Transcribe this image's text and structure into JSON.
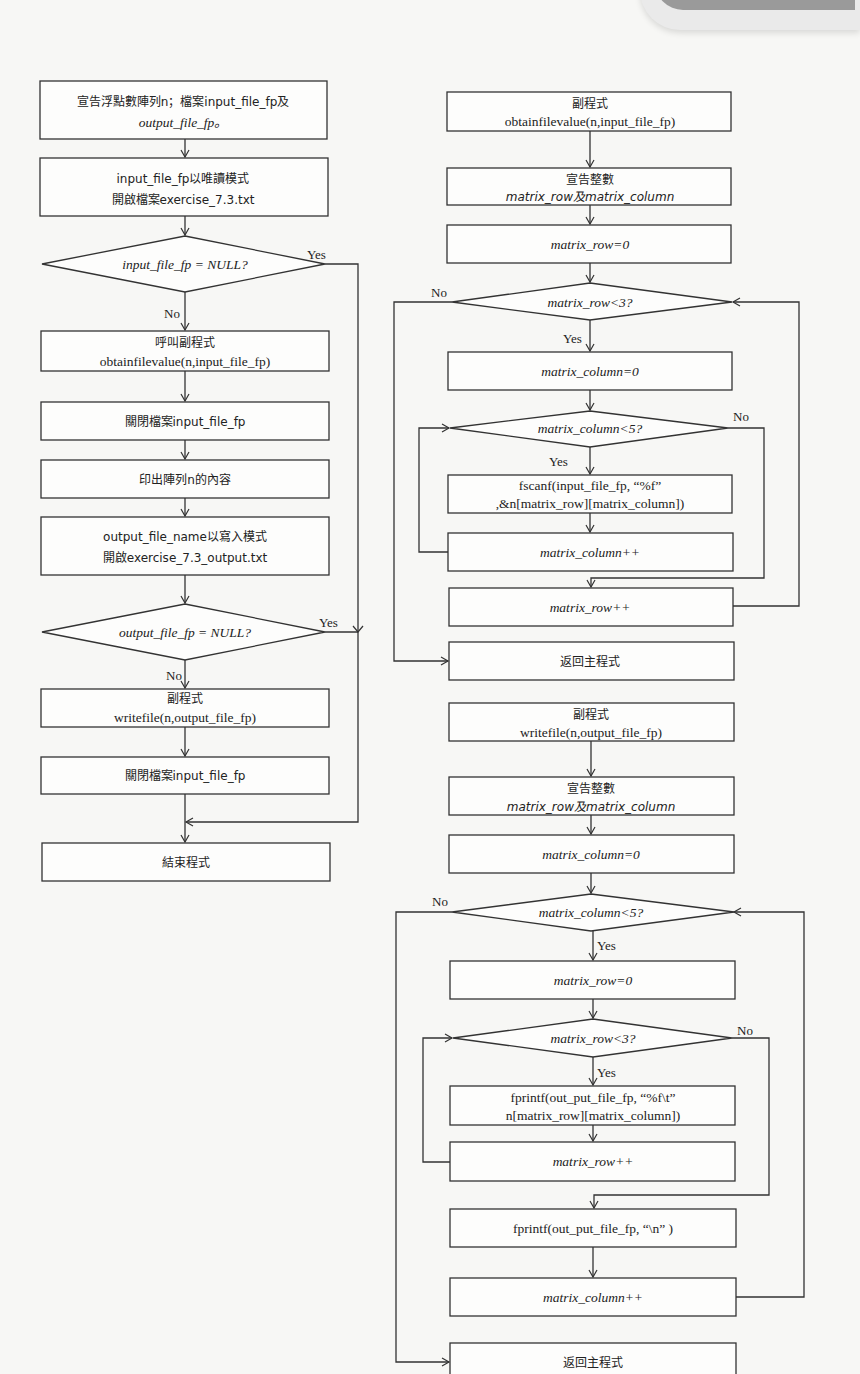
{
  "main_flow": {
    "declare": {
      "line1": "宣告浮點數陣列n；檔案input_file_fp及",
      "line2": "output_file_fp。"
    },
    "open_input": {
      "line1": "input_file_fp以唯讀模式",
      "line2": "開啟檔案exercise_7.3.txt"
    },
    "check_input": {
      "text": "input_file_fp = NULL?",
      "yes": "Yes",
      "no": "No"
    },
    "call_obtain": {
      "line1": "呼叫副程式",
      "line2": "obtainfilevalue(n,input_file_fp)"
    },
    "close_input": {
      "text": "關閉檔案input_file_fp"
    },
    "print_array": {
      "text": "印出陣列n的內容"
    },
    "open_output": {
      "line1": "output_file_name以寫入模式",
      "line2": "開啟exercise_7.3_output.txt"
    },
    "check_output": {
      "text": "output_file_fp = NULL?",
      "yes": "Yes",
      "no": "No"
    },
    "call_write": {
      "line1": "副程式",
      "line2": "writefile(n,output_file_fp)"
    },
    "close_file": {
      "text": "關閉檔案input_file_fp"
    },
    "end": {
      "text": "結束程式"
    }
  },
  "obtain_flow": {
    "header": {
      "line1": "副程式",
      "line2": "obtainfilevalue(n,input_file_fp)"
    },
    "declare": {
      "line1": "宣告整數",
      "line2": "matrix_row及matrix_column"
    },
    "init_row": {
      "text": "matrix_row=0"
    },
    "check_row": {
      "text": "matrix_row<3?",
      "yes": "Yes",
      "no": "No"
    },
    "init_col": {
      "text": "matrix_column=0"
    },
    "check_col": {
      "text": "matrix_column<5?",
      "yes": "Yes",
      "no": "No"
    },
    "fscanf": {
      "line1": "fscanf(input_file_fp, “%f”",
      "line2": ",&n[matrix_row][matrix_column])"
    },
    "inc_col": {
      "text": "matrix_column++"
    },
    "inc_row": {
      "text": "matrix_row++"
    },
    "return": {
      "text": "返回主程式"
    }
  },
  "write_flow": {
    "header": {
      "line1": "副程式",
      "line2": "writefile(n,output_file_fp)"
    },
    "declare": {
      "line1": "宣告整數",
      "line2": "matrix_row及matrix_column"
    },
    "init_col": {
      "text": "matrix_column=0"
    },
    "check_col": {
      "text": "matrix_column<5?",
      "yes": "Yes",
      "no": "No"
    },
    "init_row": {
      "text": "matrix_row=0"
    },
    "check_row": {
      "text": "matrix_row<3?",
      "yes": "Yes",
      "no": "No"
    },
    "fprintf_val": {
      "line1": "fprintf(out_put_file_fp, “%f\\t”",
      "line2": "n[matrix_row][matrix_column])"
    },
    "inc_row": {
      "text": "matrix_row++"
    },
    "fprintf_nl": {
      "text": "fprintf(out_put_file_fp, “\\n” )"
    },
    "inc_col": {
      "text": "matrix_column++"
    },
    "return": {
      "text": "返回主程式"
    }
  }
}
